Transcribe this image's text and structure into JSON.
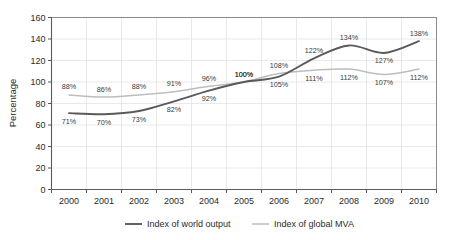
{
  "chart_data": {
    "type": "line",
    "title": "",
    "subtitle": "",
    "xlabel": "",
    "ylabel": "Percentage",
    "categories": [
      "2000",
      "2001",
      "2002",
      "2003",
      "2004",
      "2005",
      "2006",
      "2007",
      "2008",
      "2009",
      "2010"
    ],
    "ylim": [
      0,
      160
    ],
    "ytick_labels": [
      "0",
      "20",
      "40",
      "60",
      "80",
      "100",
      "120",
      "140",
      "160"
    ],
    "ytick_values": [
      0,
      20,
      40,
      60,
      80,
      100,
      120,
      140,
      160
    ],
    "grid": true,
    "legend_position": "bottom",
    "series": [
      {
        "name": "Index of world output",
        "color": "#5a5a5a",
        "values": [
          71,
          70,
          73,
          82,
          92,
          100,
          105,
          122,
          134,
          127,
          138
        ],
        "labels": [
          "71%",
          "70%",
          "73%",
          "82%",
          "92%",
          "100%",
          "105%",
          "122%",
          "134%",
          "127%",
          "138%"
        ],
        "label_placement": [
          "below",
          "below",
          "below",
          "below",
          "below",
          "above",
          "below",
          "above",
          "above",
          "below",
          "above"
        ]
      },
      {
        "name": "Index of global MVA",
        "color": "#bdbdbd",
        "values": [
          88,
          86,
          88,
          91,
          96,
          100,
          108,
          111,
          112,
          107,
          112
        ],
        "labels": [
          "88%",
          "86%",
          "88%",
          "91%",
          "96%",
          "100%",
          "108%",
          "111%",
          "112%",
          "107%",
          "112%"
        ],
        "label_placement": [
          "above",
          "above",
          "above",
          "above",
          "above",
          "above",
          "above",
          "below",
          "below",
          "below",
          "below"
        ]
      }
    ]
  },
  "legend": {
    "items": [
      {
        "label": "Index of world output",
        "color": "#5a5a5a"
      },
      {
        "label": "Index of global MVA",
        "color": "#bdbdbd"
      }
    ]
  },
  "axes": {
    "y_axis_title": "Percentage"
  }
}
